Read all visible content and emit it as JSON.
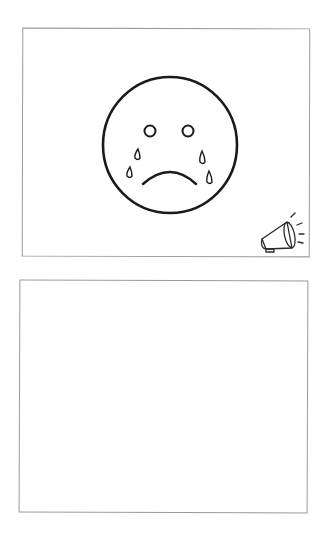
{
  "panels": [
    {
      "id": "top",
      "caption": "Crying sad face with megaphone sound icon",
      "face": {
        "expression": "sad",
        "tears": 4
      },
      "sound_icon": "megaphone-icon"
    },
    {
      "id": "bottom",
      "caption": "Empty answer box"
    }
  ],
  "colors": {
    "stroke": "#1a1a1a",
    "border": "#9a9a9a",
    "background": "#ffffff"
  }
}
